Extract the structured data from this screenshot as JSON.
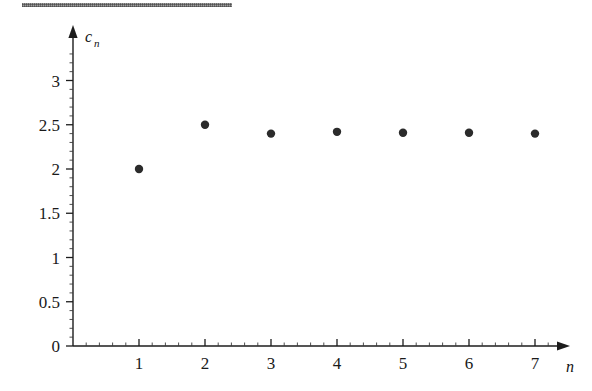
{
  "figure": {
    "background_color": "#ffffff",
    "ink_color": "#2b2b2b",
    "scan_artifact_label": "scan-edge-band"
  },
  "chart_data": {
    "type": "scatter",
    "title": "",
    "subtitle": "",
    "xlabel": "n",
    "ylabel": "c_n",
    "ylabel_base": "c",
    "ylabel_subscript": "n",
    "x": [
      1,
      2,
      3,
      4,
      5,
      6,
      7
    ],
    "values": [
      2.0,
      2.5,
      2.4,
      2.42,
      2.41,
      2.41,
      2.4
    ],
    "series": [
      {
        "name": "c_n",
        "x": [
          1,
          2,
          3,
          4,
          5,
          6,
          7
        ],
        "values": [
          2.0,
          2.5,
          2.4,
          2.42,
          2.41,
          2.41,
          2.4
        ]
      }
    ],
    "xlim": [
      0,
      7.8
    ],
    "ylim": [
      0,
      3.35
    ],
    "xticks": [
      1,
      2,
      3,
      4,
      5,
      6,
      7
    ],
    "xtick_labels": [
      "1",
      "2",
      "3",
      "4",
      "5",
      "6",
      "7"
    ],
    "yticks": [
      0,
      0.5,
      1,
      1.5,
      2,
      2.5,
      3
    ],
    "ytick_labels": [
      "0",
      "0.5",
      "1",
      "1.5",
      "2",
      "2.5",
      "3"
    ],
    "x_minor_step": 0.2,
    "y_minor_step": 0.1,
    "grid": false,
    "legend": false,
    "legend_position": "none",
    "marker": "filled-circle",
    "marker_radius_px": 4.2,
    "axis_arrows": true,
    "annotations": []
  }
}
